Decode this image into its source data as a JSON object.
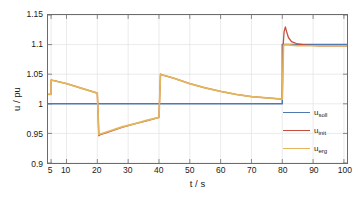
{
  "chart_data": {
    "type": "line",
    "title": "",
    "xlabel": "t / s",
    "ylabel": "u / pu",
    "xlim": [
      4,
      101
    ],
    "ylim": [
      0.9,
      1.15
    ],
    "grid": true,
    "legend_position": "right-middle",
    "xticks": [
      5,
      10,
      20,
      30,
      40,
      50,
      60,
      70,
      80,
      90,
      100
    ],
    "xtick_labels": [
      "5",
      "10",
      "20",
      "30",
      "40",
      "50",
      "60",
      "70",
      "80",
      "90",
      "100"
    ],
    "yticks": [
      0.9,
      0.95,
      1,
      1.05,
      1.1,
      1.15
    ],
    "ytick_labels": [
      "0.9",
      "0.95",
      "1",
      "1.05",
      "1.1",
      "1.15"
    ],
    "series": [
      {
        "name": "u_soll",
        "label": "u",
        "sub": "soll",
        "color": "#4E79B2",
        "x": [
          4,
          80,
          80,
          101
        ],
        "y": [
          1.0,
          1.0,
          1.1,
          1.1
        ]
      },
      {
        "name": "u_init",
        "label": "u",
        "sub": "init",
        "color": "#C4503C",
        "x": [
          4,
          5,
          5,
          6,
          10,
          15,
          20,
          20,
          20.5,
          21,
          24,
          28,
          32,
          36,
          40,
          40,
          40.5,
          41,
          45,
          50,
          55,
          60,
          65,
          70,
          75,
          80,
          80,
          80.3,
          80.6,
          81,
          81.4,
          82,
          83,
          85,
          88,
          92,
          96,
          101
        ],
        "y": [
          1.016,
          1.016,
          1.04,
          1.039,
          1.034,
          1.026,
          1.018,
          1.018,
          0.946,
          0.948,
          0.953,
          0.96,
          0.966,
          0.971,
          0.977,
          0.977,
          1.05,
          1.049,
          1.043,
          1.034,
          1.027,
          1.021,
          1.016,
          1.012,
          1.01,
          1.008,
          1.008,
          1.1,
          1.122,
          1.13,
          1.122,
          1.112,
          1.105,
          1.101,
          1.099,
          1.098,
          1.098,
          1.098
        ]
      },
      {
        "name": "u_erg",
        "label": "u",
        "sub": "erg",
        "color": "#E3B55C",
        "x": [
          4,
          5,
          5,
          6,
          10,
          15,
          20,
          20,
          20.5,
          21,
          24,
          28,
          32,
          36,
          40,
          40,
          40.5,
          41,
          45,
          50,
          55,
          60,
          65,
          70,
          75,
          80,
          80,
          80.4,
          81,
          82,
          83,
          85,
          88,
          92,
          96,
          101
        ],
        "y": [
          1.016,
          1.016,
          1.04,
          1.039,
          1.034,
          1.026,
          1.018,
          1.018,
          0.948,
          0.949,
          0.954,
          0.961,
          0.966,
          0.972,
          0.977,
          0.977,
          1.05,
          1.049,
          1.043,
          1.034,
          1.027,
          1.021,
          1.016,
          1.012,
          1.01,
          1.008,
          1.008,
          1.099,
          1.1,
          1.1,
          1.099,
          1.098,
          1.098,
          1.098,
          1.098,
          1.098
        ]
      }
    ]
  },
  "axes": {
    "ylabel_text": "u / pu",
    "xlabel_text": "t / s"
  },
  "legend": {
    "items": [
      {
        "label": "u",
        "sub": "soll",
        "color": "#4E79B2"
      },
      {
        "label": "u",
        "sub": "init",
        "color": "#C4503C"
      },
      {
        "label": "u",
        "sub": "erg",
        "color": "#E3B55C"
      }
    ]
  },
  "style": {
    "grid_color": "#e2e2e2",
    "axis_color": "#6b6b6b",
    "background": "#ffffff"
  }
}
